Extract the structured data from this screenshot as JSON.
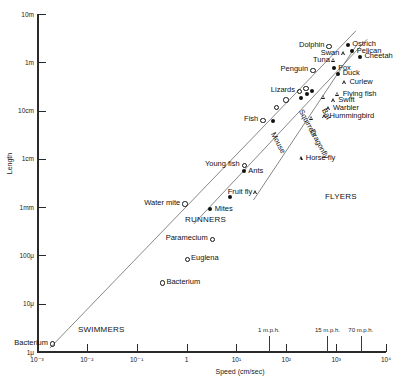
{
  "chart_data": {
    "type": "scatter",
    "title": "",
    "xlabel": "Speed (cm/sec)",
    "ylabel": "Length",
    "xscale": "log",
    "yscale": "log",
    "xlim": [
      0.001,
      10000
    ],
    "ylim": [
      0.0001,
      1000
    ],
    "grid": false,
    "legend": "none",
    "x_tick_labels": [
      "10⁻³",
      "10⁻²",
      "10⁻¹",
      "1",
      "10¹",
      "10²",
      "10³",
      "10⁴"
    ],
    "y_tick_labels": [
      "10m",
      "1m",
      "10cm",
      "1cm",
      "1mm",
      "100μ",
      "10μ",
      "1μ"
    ],
    "secondary_x_ticks": [
      {
        "label": "1 m.p.h.",
        "speed_cm_s": 44.7
      },
      {
        "label": "15 m.p.h.",
        "speed_cm_s": 670
      },
      {
        "label": "70 m.p.h.",
        "speed_cm_s": 3130
      }
    ],
    "group_labels": [
      "SWIMMERS",
      "RUNNERS",
      "FLYERS"
    ],
    "series": [
      {
        "name": "Swimmers",
        "marker": "open-circle",
        "points": [
          {
            "label": "Bacterium",
            "x": 0.002,
            "y": 0.00015,
            "label_pos": "left"
          },
          {
            "label": "Bacterium",
            "x": 0.32,
            "y": 0.0028,
            "label_pos": "right"
          },
          {
            "label": "Euglena",
            "x": 1.0,
            "y": 0.0085,
            "label_pos": "right"
          },
          {
            "label": "Paramecium",
            "x": 3.2,
            "y": 0.022,
            "label_pos": "left"
          },
          {
            "label": "Water mite",
            "x": 0.9,
            "y": 0.12,
            "label_pos": "left"
          },
          {
            "label": "Young fish",
            "x": 14.0,
            "y": 0.75,
            "label_pos": "left"
          },
          {
            "label": "Fish",
            "x": 33.0,
            "y": 6.5,
            "label_pos": "left"
          },
          {
            "label": "Fish",
            "x": 62.0,
            "y": 12.0,
            "label_pos": "none"
          },
          {
            "label": "Fish",
            "x": 95.0,
            "y": 17.0,
            "label_pos": "none"
          },
          {
            "label": "Lizards",
            "x": 180.0,
            "y": 26.0,
            "label_pos": "left"
          },
          {
            "label": "Lizards",
            "x": 240.0,
            "y": 30.0,
            "label_pos": "none"
          },
          {
            "label": "Penguin",
            "x": 330.0,
            "y": 70.0,
            "label_pos": "left"
          },
          {
            "label": "Dolphin",
            "x": 700.0,
            "y": 220.0,
            "label_pos": "left"
          }
        ]
      },
      {
        "name": "Runners",
        "marker": "filled-circle",
        "points": [
          {
            "label": "Mites",
            "x": 3.0,
            "y": 0.09,
            "label_pos": "right"
          },
          {
            "label": "Mites",
            "x": 7.5,
            "y": 0.16,
            "label_pos": "none"
          },
          {
            "label": "Ants",
            "x": 14.0,
            "y": 0.55,
            "label_pos": "right"
          },
          {
            "label": "Mouse",
            "x": 55.0,
            "y": 6.0,
            "label_pos": "rot"
          },
          {
            "label": "Squirrels",
            "x": 200.0,
            "y": 18.0,
            "label_pos": "rot"
          },
          {
            "label": "Squirrels",
            "x": 260.0,
            "y": 22.0,
            "label_pos": "none"
          },
          {
            "label": "Squirrels",
            "x": 330.0,
            "y": 25.0,
            "label_pos": "none"
          },
          {
            "label": "Fox",
            "x": 900.0,
            "y": 75.0,
            "label_pos": "right"
          },
          {
            "label": "Duck",
            "x": 1100.0,
            "y": 58.0,
            "label_pos": "right"
          },
          {
            "label": "Cheetah",
            "x": 3000.0,
            "y": 130.0,
            "label_pos": "right"
          },
          {
            "label": "Pelican",
            "x": 2100.0,
            "y": 170.0,
            "label_pos": "right"
          },
          {
            "label": "Ostrich",
            "x": 1700.0,
            "y": 230.0,
            "label_pos": "right"
          }
        ]
      },
      {
        "name": "Flyers",
        "marker": "open-triangle",
        "points": [
          {
            "label": "Fruit fly",
            "x": 25.0,
            "y": 0.2,
            "label_pos": "left"
          },
          {
            "label": "Horse fly",
            "x": 200.0,
            "y": 1.0,
            "label_pos": "right"
          },
          {
            "label": "Dragonfly",
            "x": 330.0,
            "y": 7.0,
            "label_pos": "rot"
          },
          {
            "label": "Hummingbird",
            "x": 600.0,
            "y": 7.5,
            "label_pos": "right"
          },
          {
            "label": "Warbler",
            "x": 700.0,
            "y": 11.0,
            "label_pos": "right"
          },
          {
            "label": "Swift",
            "x": 900.0,
            "y": 16.0,
            "label_pos": "right"
          },
          {
            "label": "Bat",
            "x": 560.0,
            "y": 19.0,
            "label_pos": "rot"
          },
          {
            "label": "Flying fish",
            "x": 1100.0,
            "y": 22.0,
            "label_pos": "right"
          },
          {
            "label": "Curlew",
            "x": 1500.0,
            "y": 38.0,
            "label_pos": "right"
          },
          {
            "label": "Tuna",
            "x": 900.0,
            "y": 110.0,
            "label_pos": "left"
          },
          {
            "label": "Swan",
            "x": 1400.0,
            "y": 150.0,
            "label_pos": "left"
          }
        ]
      }
    ],
    "trend_lines": [
      {
        "name": "swimmers-line",
        "x1": 0.0018,
        "y1": 0.00012,
        "x2": 2500,
        "y2": 450
      },
      {
        "name": "runners-line",
        "x1": 1.4,
        "y1": 0.045,
        "x2": 4200,
        "y2": 300
      },
      {
        "name": "flyers-line",
        "x1": 22,
        "y1": 0.14,
        "x2": 2600,
        "y2": 230
      }
    ]
  },
  "axes": {
    "y": {
      "label": "Length",
      "ticks": [
        {
          "label": "10m",
          "value": 1000
        },
        {
          "label": "1m",
          "value": 100
        },
        {
          "label": "10cm",
          "value": 10
        },
        {
          "label": "1cm",
          "value": 1
        },
        {
          "label": "1mm",
          "value": 0.1
        },
        {
          "label": "100μ",
          "value": 0.01
        },
        {
          "label": "10μ",
          "value": 0.001
        },
        {
          "label": "1μ",
          "value": 0.0001
        }
      ]
    },
    "x": {
      "label": "Speed (cm/sec)",
      "ticks": [
        {
          "label": "10⁻³",
          "value": 0.001
        },
        {
          "label": "10⁻²",
          "value": 0.01
        },
        {
          "label": "10⁻¹",
          "value": 0.1
        },
        {
          "label": "1",
          "value": 1
        },
        {
          "label": "10¹",
          "value": 10
        },
        {
          "label": "10²",
          "value": 100
        },
        {
          "label": "10³",
          "value": 1000
        },
        {
          "label": "10⁴",
          "value": 10000
        }
      ],
      "mph_ticks": [
        {
          "label": "1 m.p.h.",
          "value": 44.7
        },
        {
          "label": "15 m.p.h.",
          "value": 670
        },
        {
          "label": "70 m.p.h.",
          "value": 3130
        }
      ]
    }
  },
  "groups": {
    "swimmers": "SWIMMERS",
    "runners": "RUNNERS",
    "flyers": "FLYERS"
  },
  "colors": {
    "axis": "#2a2a2a",
    "marker": "#111111",
    "line": "#6a6a6a",
    "background": "#ffffff"
  }
}
